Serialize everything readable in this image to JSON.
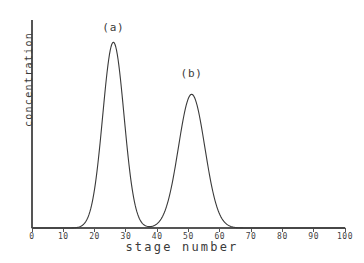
{
  "chart_data": {
    "type": "line",
    "title": "",
    "subtitle": "",
    "xlabel": "stage number",
    "ylabel": "concentration",
    "xlim": [
      0,
      100
    ],
    "ylim": [
      0,
      1.12
    ],
    "grid": false,
    "legend": "none",
    "x_ticks": [
      0,
      10,
      20,
      30,
      40,
      50,
      60,
      70,
      80,
      90,
      100
    ],
    "x_tick_labels": [
      "0",
      "10",
      "20",
      "30",
      "40",
      "50",
      "60",
      "70",
      "80",
      "90",
      "100"
    ],
    "y_ticks": [],
    "y_tick_labels": [],
    "line_color": "#3a3a3a",
    "axis_color": "#555555",
    "background_color": "#ffffff",
    "annotations": [
      {
        "text": "(a)",
        "x": 26,
        "y": 1.05,
        "target_peak": "a"
      },
      {
        "text": "(b)",
        "x": 51,
        "y": 0.8,
        "target_peak": "b"
      }
    ],
    "series": [
      {
        "name": "distribution curve",
        "description": "Two resolved Gaussian bands along the stage axis",
        "peaks": [
          {
            "label": "(a)",
            "center": 26,
            "sigma": 3.4,
            "height": 1.0
          },
          {
            "label": "(b)",
            "center": 51,
            "sigma": 4.2,
            "height": 0.72
          }
        ],
        "x": [
          0,
          2,
          4,
          6,
          8,
          10,
          12,
          13,
          14,
          15,
          16,
          17,
          18,
          19,
          20,
          21,
          22,
          23,
          24,
          25,
          26,
          27,
          28,
          29,
          30,
          31,
          32,
          33,
          34,
          35,
          36,
          37,
          38,
          39,
          40,
          41,
          42,
          43,
          44,
          45,
          46,
          47,
          48,
          49,
          50,
          51,
          52,
          53,
          54,
          55,
          56,
          57,
          58,
          59,
          60,
          61,
          62,
          63,
          64,
          65,
          66,
          67,
          68,
          70,
          75,
          80,
          85,
          90,
          95,
          100
        ],
        "values": [
          0,
          0,
          0,
          0,
          0,
          0,
          0.001,
          0.003,
          0.006,
          0.013,
          0.026,
          0.049,
          0.086,
          0.142,
          0.219,
          0.318,
          0.434,
          0.556,
          0.675,
          0.778,
          0.854,
          0.898,
          0.908,
          0.886,
          0.838,
          0.769,
          0.688,
          0.601,
          0.515,
          0.434,
          0.361,
          0.302,
          0.264,
          0.253,
          0.273,
          0.324,
          0.399,
          0.486,
          0.57,
          0.64,
          0.689,
          0.713,
          0.714,
          0.695,
          0.662,
          0.634,
          0.616,
          0.598,
          0.57,
          0.531,
          0.482,
          0.427,
          0.369,
          0.311,
          0.256,
          0.206,
          0.162,
          0.124,
          0.093,
          0.068,
          0.048,
          0.034,
          0.023,
          0.01,
          0.001,
          0,
          0,
          0,
          0,
          0
        ]
      }
    ]
  },
  "axes": {
    "x_title": "stage number",
    "y_title": "concentration"
  },
  "labels": {
    "peak_a": "(a)",
    "peak_b": "(b)"
  },
  "x_tick_labels": {
    "t0": "0",
    "t1": "10",
    "t2": "20",
    "t3": "30",
    "t4": "40",
    "t5": "50",
    "t6": "60",
    "t7": "70",
    "t8": "80",
    "t9": "90",
    "t10": "100"
  }
}
